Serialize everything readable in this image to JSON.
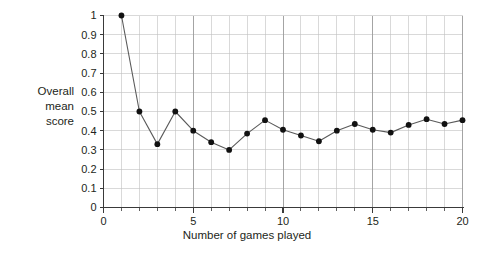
{
  "chart_data": {
    "type": "line",
    "title": "",
    "subtitle": "",
    "xlabel": "Number of games played",
    "ylabel": "Overall mean score",
    "ylabel_lines": [
      "Overall",
      "mean",
      "score"
    ],
    "xlim": [
      0,
      20
    ],
    "ylim": [
      0,
      1
    ],
    "grid": true,
    "legend": "none",
    "marker": "filled-circle",
    "line_color": "#5a5a5a",
    "marker_color": "#111111",
    "grid_color": "#bfbfbf",
    "axis_color": "#3a3a3a",
    "x_tick_labels": [
      "0",
      "5",
      "10",
      "15",
      "20"
    ],
    "x_tick_values": [
      0,
      5,
      10,
      15,
      20
    ],
    "x_minor_step": 1,
    "y_tick_labels": [
      "0",
      "0.1",
      "0.2",
      "0.3",
      "0.4",
      "0.5",
      "0.6",
      "0.7",
      "0.8",
      "0.9",
      "1"
    ],
    "y_tick_values": [
      0,
      0.1,
      0.2,
      0.3,
      0.4,
      0.5,
      0.6,
      0.7,
      0.8,
      0.9,
      1
    ],
    "x": [
      1,
      2,
      3,
      4,
      5,
      6,
      7,
      8,
      9,
      10,
      11,
      12,
      13,
      14,
      15,
      16,
      17,
      18,
      19,
      20
    ],
    "values": [
      1.0,
      0.5,
      0.33,
      0.5,
      0.4,
      0.34,
      0.3,
      0.385,
      0.455,
      0.405,
      0.375,
      0.345,
      0.4,
      0.435,
      0.405,
      0.39,
      0.43,
      0.46,
      0.435,
      0.455
    ],
    "series": [
      {
        "name": "Overall mean score",
        "values": [
          1.0,
          0.5,
          0.33,
          0.5,
          0.4,
          0.34,
          0.3,
          0.385,
          0.455,
          0.405,
          0.375,
          0.345,
          0.4,
          0.435,
          0.405,
          0.39,
          0.43,
          0.46,
          0.435,
          0.455
        ]
      }
    ]
  },
  "axes": {
    "y_label_line1": "Overall",
    "y_label_line2": "mean",
    "y_label_line3": "score",
    "x_label": "Number of games played"
  }
}
